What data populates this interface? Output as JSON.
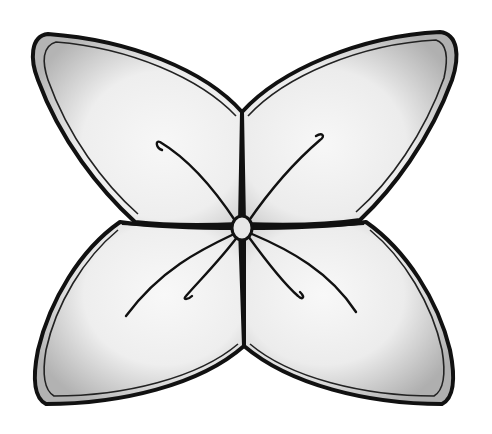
{
  "image": {
    "subject": "Pencil drawing of a four-petal flower",
    "style": "graphite shading, black ink outline",
    "colors": {
      "background": "#ffffff",
      "outline": "#111111",
      "petal_light": "#f4f4f4",
      "petal_shade": "#b9b9b9",
      "center": "#e6e6e6"
    },
    "petals": [
      "top-left",
      "top-right",
      "bottom-left",
      "bottom-right"
    ],
    "stamens": 6
  }
}
